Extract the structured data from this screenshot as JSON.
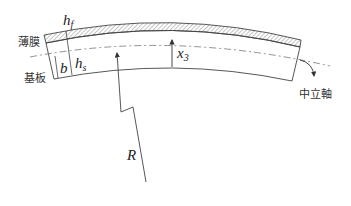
{
  "diagram": {
    "title": "",
    "labels": {
      "film": "薄膜",
      "substrate": "基板",
      "neutral_axis": "中立軸",
      "film_thickness_main": "h",
      "film_thickness_sub": "f",
      "substrate_thickness_main": "h",
      "substrate_thickness_sub": "s",
      "neutral_offset": "b",
      "coord_main": "x",
      "coord_sub": "3",
      "radius": "R"
    },
    "colors": {
      "stroke": "#333333",
      "hatch": "#888888",
      "background": "#ffffff"
    }
  }
}
